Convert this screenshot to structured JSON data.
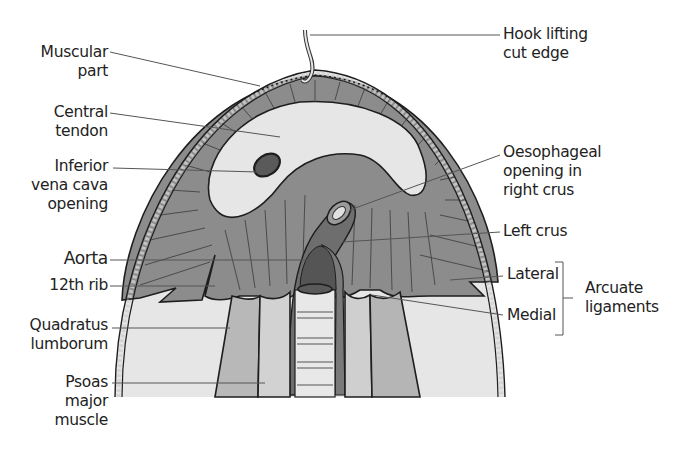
{
  "diagram": {
    "labels_left": [
      {
        "id": "muscular-part",
        "lines": [
          "Muscular",
          "part"
        ]
      },
      {
        "id": "central-tendon",
        "lines": [
          "Central",
          "tendon"
        ]
      },
      {
        "id": "ivc-opening",
        "lines": [
          "Inferior",
          "vena cava",
          "opening"
        ]
      },
      {
        "id": "aorta",
        "lines": [
          "Aorta"
        ]
      },
      {
        "id": "12th-rib",
        "lines": [
          "12th rib"
        ]
      },
      {
        "id": "quadratus-lumborum",
        "lines": [
          "Quadratus",
          "lumborum"
        ]
      },
      {
        "id": "psoas-major",
        "lines": [
          "Psoas",
          "major",
          "muscle"
        ]
      }
    ],
    "labels_right": [
      {
        "id": "hook",
        "lines": [
          "Hook lifting",
          "cut edge"
        ]
      },
      {
        "id": "oesophageal-opening",
        "lines": [
          "Oesophageal",
          "opening in",
          "right crus"
        ]
      },
      {
        "id": "left-crus",
        "lines": [
          "Left crus"
        ]
      },
      {
        "id": "lateral",
        "lines": [
          "Lateral"
        ]
      },
      {
        "id": "medial",
        "lines": [
          "Medial"
        ]
      }
    ],
    "group_label": {
      "id": "arcuate-ligaments",
      "lines": [
        "Arcuate",
        "ligaments"
      ]
    },
    "colors": {
      "muscle": "#8c8c8c",
      "tendon": "#e6e6e6",
      "outline": "#1e1e1e",
      "rim": "#d9d9d9",
      "lower_bg": "#e4e4e4",
      "psoas": "#b5b5b5",
      "aorta_dark": "#5a5a5a",
      "leader": "#555555"
    }
  }
}
